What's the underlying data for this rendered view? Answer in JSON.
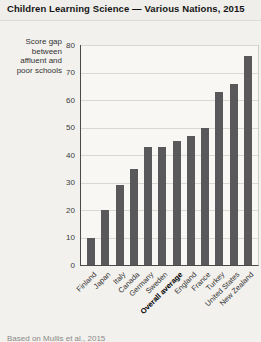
{
  "page": {
    "title": "Children Learning Science — Various Nations, 2015",
    "source": "Based on Mullis et al., 2015"
  },
  "chart_data": {
    "type": "bar",
    "title": "Children Learning Science — Various Nations, 2015",
    "ylabel": "Score gap between affluent and poor schools",
    "xlabel": "",
    "categories": [
      "Finland",
      "Japan",
      "Italy",
      "Canada",
      "Germany",
      "Sweden",
      "Overall average",
      "England",
      "France",
      "Turkey",
      "United States",
      "New Zealand"
    ],
    "values": [
      10,
      20,
      29,
      35,
      43,
      43,
      45,
      47,
      50,
      63,
      66,
      76
    ],
    "bold_category": "Overall average",
    "ylim": [
      0,
      80
    ],
    "yticks": [
      0,
      10,
      20,
      30,
      40,
      50,
      60,
      70,
      80
    ],
    "grid": true,
    "legend": "none",
    "bar_color": "#59595b"
  }
}
